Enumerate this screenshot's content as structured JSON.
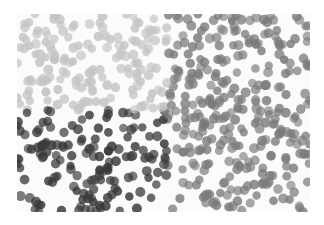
{
  "image": {
    "description": "Grayscale field of many small circular particles with varying shading: light upper-left, dark lower-left, medium gray on the right",
    "frame": {
      "left": 17,
      "top": 14,
      "width": 293,
      "height": 198
    },
    "background": "#fbfbfb",
    "dot_radius": 4.6,
    "dot_count": 620,
    "seed": 7,
    "regions": [
      {
        "name": "upper-left-light",
        "x0": 0,
        "x1": 150,
        "y0": 0,
        "y1": 96,
        "color": "#c4c4c4",
        "opacity": 0.75
      },
      {
        "name": "lower-left-dark",
        "x0": 0,
        "x1": 150,
        "y0": 96,
        "y1": 198,
        "color": "#3a3a3a",
        "opacity": 0.75
      },
      {
        "name": "right-medium",
        "x0": 150,
        "x1": 293,
        "y0": 0,
        "y1": 198,
        "color": "#7a7a7a",
        "opacity": 0.72
      }
    ]
  }
}
